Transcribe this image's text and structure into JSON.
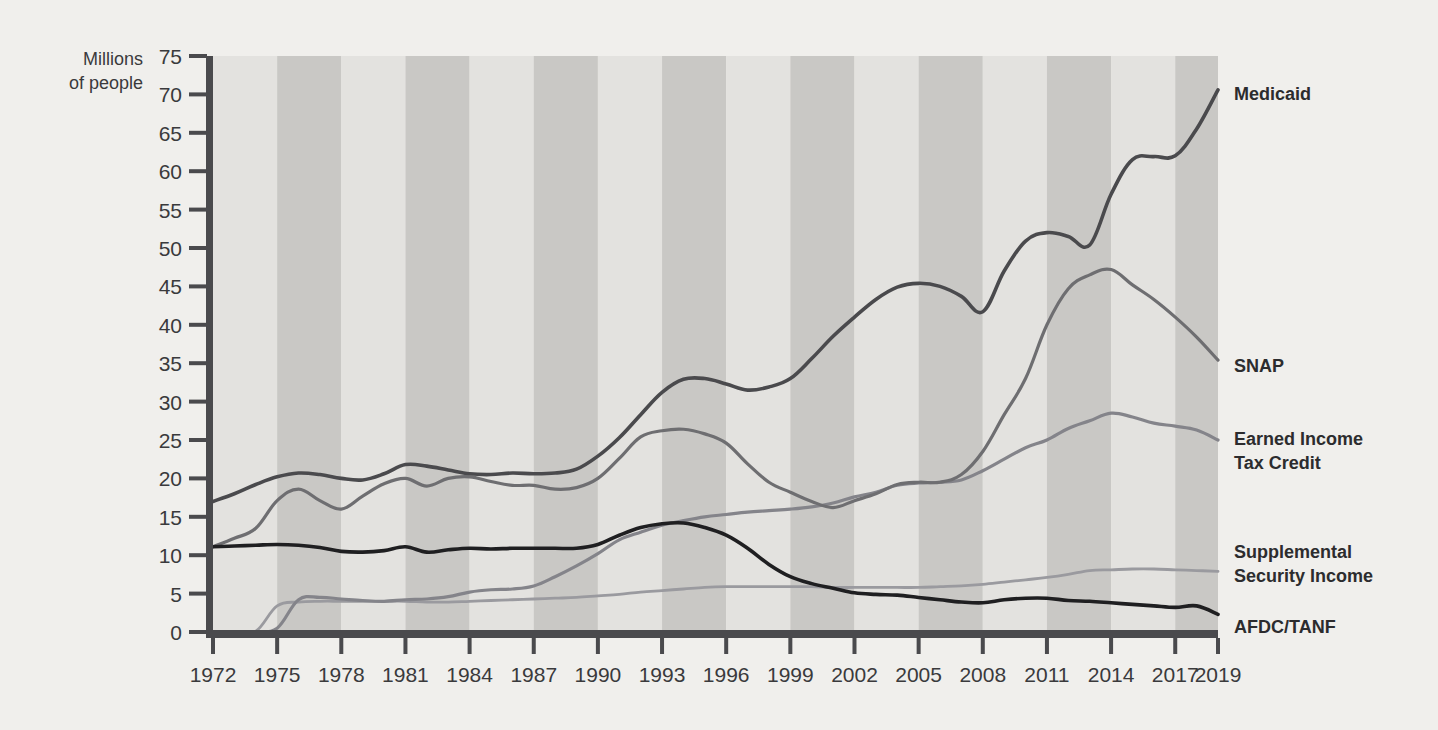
{
  "chart_data": {
    "type": "line",
    "title": "",
    "subtitle": "",
    "xlabel": "",
    "ylabel": "Millions of people",
    "ylabel_line1": "Millions",
    "ylabel_line2": "of people",
    "xlim": [
      1972,
      2019
    ],
    "ylim": [
      0,
      75
    ],
    "ytick_step": 5,
    "grid": false,
    "legend_position": "right-of-plot (direct labels at line ends)",
    "background_bands": "alternating light/medium gray vertical bands, ~3-year width",
    "yticks": [
      0,
      5,
      10,
      15,
      20,
      25,
      30,
      35,
      40,
      45,
      50,
      55,
      60,
      65,
      70,
      75
    ],
    "ytick_labels": [
      "0",
      "5",
      "10",
      "15",
      "20",
      "25",
      "30",
      "35",
      "40",
      "45",
      "50",
      "55",
      "60",
      "65",
      "70",
      "75"
    ],
    "xticks": [
      1972,
      1975,
      1978,
      1981,
      1984,
      1987,
      1990,
      1993,
      1996,
      1999,
      2002,
      2005,
      2008,
      2011,
      2014,
      2017,
      2019
    ],
    "xtick_labels": [
      "1972",
      "1975",
      "1978",
      "1981",
      "1984",
      "1987",
      "1990",
      "1993",
      "1996",
      "1999",
      "2002",
      "2005",
      "2008",
      "2011",
      "2014",
      "2017",
      "2019"
    ],
    "x": [
      1972,
      1973,
      1974,
      1975,
      1976,
      1977,
      1978,
      1979,
      1980,
      1981,
      1982,
      1983,
      1984,
      1985,
      1986,
      1987,
      1988,
      1989,
      1990,
      1991,
      1992,
      1993,
      1994,
      1995,
      1996,
      1997,
      1998,
      1999,
      2000,
      2001,
      2002,
      2003,
      2004,
      2005,
      2006,
      2007,
      2008,
      2009,
      2010,
      2011,
      2012,
      2013,
      2014,
      2015,
      2016,
      2017,
      2018,
      2019
    ],
    "series": [
      {
        "name": "Medicaid",
        "color": "#4a4a4d",
        "width": 3.6,
        "label": "Medicaid",
        "values": [
          17.0,
          18.0,
          19.2,
          20.2,
          20.7,
          20.5,
          20.0,
          19.8,
          20.6,
          21.8,
          21.6,
          21.1,
          20.6,
          20.5,
          20.7,
          20.6,
          20.7,
          21.2,
          22.9,
          25.3,
          28.3,
          31.2,
          32.9,
          33.0,
          32.3,
          31.5,
          31.9,
          33.0,
          35.6,
          38.5,
          41.0,
          43.3,
          44.9,
          45.4,
          45.0,
          43.7,
          41.7,
          47.0,
          50.9,
          52.0,
          51.5,
          50.4,
          57.0,
          61.5,
          61.9,
          62.0,
          65.5,
          70.6
        ]
      },
      {
        "name": "SNAP",
        "color": "#6e6e71",
        "width": 3.2,
        "label": "SNAP",
        "values": [
          11.1,
          12.2,
          13.5,
          17.1,
          18.6,
          17.1,
          16.0,
          17.7,
          19.3,
          20.0,
          19.0,
          20.0,
          20.2,
          19.6,
          19.1,
          19.1,
          18.6,
          18.8,
          20.0,
          22.6,
          25.4,
          26.2,
          26.4,
          25.8,
          24.6,
          21.9,
          19.5,
          18.2,
          17.0,
          16.2,
          17.1,
          18.0,
          19.2,
          19.5,
          19.5,
          20.5,
          23.5,
          28.3,
          33.0,
          40.0,
          44.7,
          46.5,
          47.2,
          45.2,
          43.3,
          41.0,
          38.4,
          35.4
        ]
      },
      {
        "name": "Earned Income Tax Credit",
        "color": "#84848a",
        "width": 3.2,
        "label": "Earned Income Tax Credit",
        "label_line1": "Earned Income",
        "label_line2": "Tax Credit",
        "values": [
          0,
          0,
          0,
          0.5,
          4.2,
          4.5,
          4.3,
          4.1,
          4.0,
          4.2,
          4.3,
          4.6,
          5.2,
          5.5,
          5.6,
          6.0,
          7.2,
          8.6,
          10.2,
          12.0,
          13.0,
          13.9,
          14.5,
          15.0,
          15.3,
          15.6,
          15.8,
          16.0,
          16.3,
          16.8,
          17.6,
          18.2,
          19.1,
          19.4,
          19.5,
          19.8,
          21.0,
          22.5,
          24.0,
          25.0,
          26.5,
          27.5,
          28.5,
          28.0,
          27.2,
          26.8,
          26.3,
          25.0
        ]
      },
      {
        "name": "Supplemental Security Income",
        "color": "#9a9a9f",
        "width": 2.8,
        "label": "Supplemental Security Income",
        "label_line1": "Supplemental",
        "label_line2": "Security Income",
        "values": [
          0,
          0,
          0.1,
          3.4,
          3.9,
          4.0,
          4.0,
          4.0,
          4.0,
          4.0,
          3.9,
          3.9,
          4.0,
          4.1,
          4.2,
          4.3,
          4.4,
          4.5,
          4.7,
          4.9,
          5.2,
          5.4,
          5.6,
          5.8,
          5.9,
          5.9,
          5.9,
          5.9,
          5.9,
          5.8,
          5.8,
          5.8,
          5.8,
          5.8,
          5.9,
          6.0,
          6.2,
          6.5,
          6.8,
          7.1,
          7.5,
          8.0,
          8.1,
          8.2,
          8.2,
          8.1,
          8.0,
          7.9
        ]
      },
      {
        "name": "AFDC/TANF",
        "color": "#1f1f21",
        "width": 3.6,
        "label": "AFDC/TANF",
        "values": [
          11.1,
          11.2,
          11.3,
          11.4,
          11.3,
          11.0,
          10.5,
          10.4,
          10.6,
          11.1,
          10.4,
          10.7,
          10.9,
          10.8,
          10.9,
          10.9,
          10.9,
          10.9,
          11.4,
          12.6,
          13.6,
          14.1,
          14.2,
          13.6,
          12.6,
          10.9,
          8.8,
          7.2,
          6.3,
          5.7,
          5.1,
          4.9,
          4.8,
          4.5,
          4.2,
          3.9,
          3.8,
          4.2,
          4.4,
          4.4,
          4.1,
          4.0,
          3.8,
          3.6,
          3.4,
          3.2,
          3.4,
          2.3
        ]
      }
    ],
    "series_end_labels": [
      {
        "name": "Medicaid",
        "text": "Medicaid",
        "y_value": 70.6
      },
      {
        "name": "SNAP",
        "text": "SNAP",
        "y_value": 35.4
      },
      {
        "name": "Earned Income Tax Credit",
        "text": "Earned Income Tax Credit",
        "y_value": 25.0
      },
      {
        "name": "Supplemental Security Income",
        "text": "Supplemental Security Income",
        "y_value": 7.9
      },
      {
        "name": "AFDC/TANF",
        "text": "AFDC/TANF",
        "y_value": 2.3
      }
    ]
  },
  "colors": {
    "page_background": "#f0efec",
    "band_light": "#e3e2df",
    "band_dark": "#c9c8c5",
    "axis": "#4a4a4d",
    "text": "#3a3a3c",
    "label_text": "#2c2c2e"
  }
}
